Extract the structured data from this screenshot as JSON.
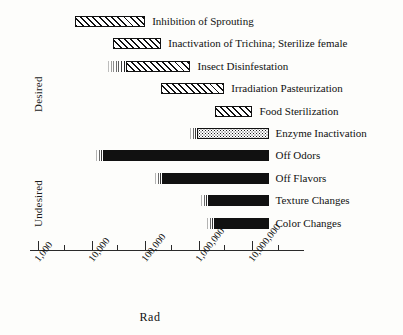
{
  "chart_data": {
    "type": "bar",
    "orientation": "horizontal",
    "title": "",
    "xlabel": "Rad",
    "ylabel": "",
    "xscale": "log",
    "xlim": [
      1000,
      30000000
    ],
    "grid": false,
    "legend": "none",
    "tick_labels": [
      "1,000",
      "10,000",
      "100,000",
      "1,000,000",
      "10,000,000"
    ],
    "tick_values": [
      1000,
      10000,
      100000,
      1000000,
      10000000
    ],
    "group_labels": [
      "Desired",
      "Undesired"
    ],
    "categories": [
      "Inhibition of Sprouting",
      "Inactivation of Trichina; Sterilize female",
      "Insect Disinfestation",
      "Irradiation Pasteurization",
      "Food Sterilization",
      "Enzyme Inactivation",
      "Off Odors",
      "Off Flavors",
      "Texture Changes",
      "Color Changes"
    ],
    "bars": [
      {
        "label": "Inhibition of Sprouting",
        "group": "Desired",
        "x_start": 5000,
        "x_end": 100000,
        "fill": "hatch",
        "lead_start": null
      },
      {
        "label": "Inactivation of Trichina; Sterilize female",
        "group": "Desired",
        "x_start": 25000,
        "x_end": 200000,
        "fill": "hatch",
        "lead_start": null
      },
      {
        "label": "Insect Disinfestation",
        "group": "Desired",
        "x_start": 20000,
        "x_end": 700000,
        "fill": "hatch",
        "lead_start": 20000
      },
      {
        "label": "Irradiation Pasteurization",
        "group": "Desired",
        "x_start": 200000,
        "x_end": 3000000,
        "fill": "hatch",
        "lead_start": null
      },
      {
        "label": "Food Sterilization",
        "group": "Desired",
        "x_start": 2000000,
        "x_end": 10000000,
        "fill": "hatch",
        "lead_start": null
      },
      {
        "label": "Enzyme Inactivation",
        "group": "Desired",
        "x_start": 700000,
        "x_end": 20000000,
        "fill": "stipple",
        "lead_start": 700000
      },
      {
        "label": "Off Odors",
        "group": "Undesired",
        "x_start": 12000,
        "x_end": 20000000,
        "fill": "solid",
        "lead_start": 12000
      },
      {
        "label": "Off Flavors",
        "group": "Undesired",
        "x_start": 150000,
        "x_end": 20000000,
        "fill": "solid",
        "lead_start": 150000
      },
      {
        "label": "Texture Changes",
        "group": "Undesired",
        "x_start": 1100000,
        "x_end": 20000000,
        "fill": "solid",
        "lead_start": 1100000
      },
      {
        "label": "Color Changes",
        "group": "Undesired",
        "x_start": 1400000,
        "x_end": 20000000,
        "fill": "solid",
        "lead_start": 1400000
      }
    ]
  },
  "axis": {
    "x_title": "Rad"
  },
  "groups": {
    "desired": "Desired",
    "undesired": "Undesired"
  }
}
